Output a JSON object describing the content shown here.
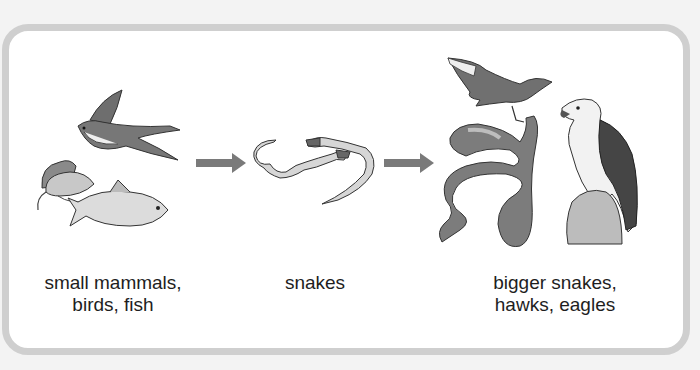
{
  "diagram": {
    "type": "food-chain",
    "colors": {
      "frame_border": "#cfcfcf",
      "arrow": "#7a7a7a",
      "text": "#1e1e1e"
    },
    "stages": [
      {
        "label_line1": "small mammals,",
        "label_line2": "birds, fish",
        "icons": [
          "swallow-bird",
          "mice",
          "fish"
        ]
      },
      {
        "label_line1": "snakes",
        "label_line2": "",
        "icons": [
          "small-snakes"
        ]
      },
      {
        "label_line1": "bigger snakes,",
        "label_line2": "hawks, eagles",
        "icons": [
          "hawk",
          "big-snake",
          "eagle"
        ]
      }
    ],
    "arrows": [
      {
        "from": 0,
        "to": 1
      },
      {
        "from": 1,
        "to": 2
      }
    ]
  }
}
